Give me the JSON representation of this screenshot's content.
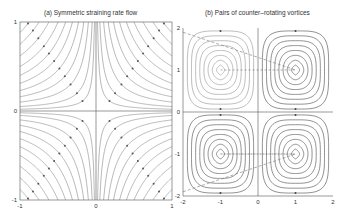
{
  "figure": {
    "panels": [
      {
        "title": "(a) Symmetric straining rate flow"
      },
      {
        "title": "(b) Pairs of counter–rotating vortices"
      }
    ]
  },
  "chart_data": [
    {
      "type": "line",
      "title": "(a) Symmetric straining rate flow",
      "description": "Streamlines of hyperbolic strain flow (xy = const) in each quadrant, with arrows showing flow direction toward the axes",
      "xlabel": "",
      "ylabel": "",
      "xlim": [
        -1,
        1
      ],
      "ylim": [
        -1,
        1
      ],
      "xticks": [
        -1,
        0,
        1
      ],
      "yticks": [
        -1,
        0,
        1
      ],
      "grid": false,
      "axes_lines": {
        "x": 0,
        "y": 0
      },
      "streamline_constants": [
        0.02,
        0.05,
        0.1,
        0.16,
        0.23,
        0.31,
        0.4,
        0.5,
        0.62,
        0.75,
        0.88
      ]
    },
    {
      "type": "line",
      "title": "(b) Pairs of counter–rotating vortices",
      "description": "Closed streamline contours of four counter-rotating vortices centered at (±1, ±1) with dashed trajectory lines",
      "xlabel": "",
      "ylabel": "",
      "xlim": [
        -2,
        2
      ],
      "ylim": [
        -2,
        2
      ],
      "xticks": [
        -2,
        -1,
        0,
        1,
        2
      ],
      "yticks": [
        -2,
        -1,
        0,
        1,
        2
      ],
      "grid": false,
      "vortex_centers": [
        [
          -1,
          1
        ],
        [
          1,
          1
        ],
        [
          -1,
          -1
        ],
        [
          1,
          -1
        ]
      ],
      "contour_levels": 8,
      "axes_lines": {
        "x": 0,
        "y": 0
      }
    }
  ],
  "labels": {
    "a": {
      "x": [
        "-1",
        "0",
        "1"
      ],
      "y": [
        "1",
        "0",
        "-1"
      ]
    },
    "b": {
      "x": [
        "-2",
        "-1",
        "0",
        "1",
        "2"
      ],
      "y": [
        "2",
        "1",
        "0",
        "-1",
        "-2"
      ]
    }
  }
}
